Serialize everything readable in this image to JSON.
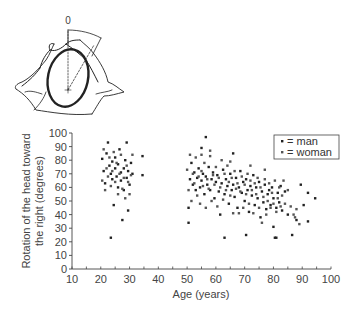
{
  "illustration": {
    "angle_label": "0",
    "description": "top-down drawing of a head on a pillow with rotation angle arc"
  },
  "chart_data": {
    "type": "scatter",
    "title": "",
    "xlabel": "Age (years)",
    "ylabel_line1": "Rotation of the head toward",
    "ylabel_line2": "the right (degrees)",
    "xlim": [
      10,
      100
    ],
    "ylim": [
      0,
      100
    ],
    "x_ticks": [
      10,
      20,
      30,
      40,
      50,
      60,
      70,
      80,
      90,
      100
    ],
    "y_ticks": [
      0,
      10,
      20,
      30,
      40,
      50,
      60,
      70,
      80,
      90,
      100
    ],
    "x_minor_step": 5,
    "grid": false,
    "legend_position": "upper right",
    "legend": [
      {
        "label": "= man",
        "color": "#222222"
      },
      {
        "label": "= woman",
        "color": "#555555"
      }
    ],
    "series": [
      {
        "name": "man",
        "color": "#222222",
        "points": [
          [
            20.5,
            81
          ],
          [
            21,
            72
          ],
          [
            21.5,
            63
          ],
          [
            22,
            85
          ],
          [
            22.5,
            93
          ],
          [
            23,
            76
          ],
          [
            23.5,
            23
          ],
          [
            23.5,
            70
          ],
          [
            24,
            66
          ],
          [
            24,
            79
          ],
          [
            24.5,
            47
          ],
          [
            25,
            74
          ],
          [
            25,
            82
          ],
          [
            25.5,
            68
          ],
          [
            26,
            60
          ],
          [
            26,
            77
          ],
          [
            26.5,
            88
          ],
          [
            27,
            71
          ],
          [
            27,
            65
          ],
          [
            27.5,
            36
          ],
          [
            28,
            74
          ],
          [
            28,
            58
          ],
          [
            28.5,
            80
          ],
          [
            29,
            93
          ],
          [
            29,
            67
          ],
          [
            29.5,
            43
          ],
          [
            29.5,
            72
          ],
          [
            30,
            62
          ],
          [
            30.5,
            78
          ],
          [
            31,
            70
          ],
          [
            34.5,
            83
          ],
          [
            34.5,
            69
          ],
          [
            50.5,
            34
          ],
          [
            50.5,
            45
          ],
          [
            51,
            66
          ],
          [
            51.5,
            78
          ],
          [
            52,
            62
          ],
          [
            52.5,
            71
          ],
          [
            53,
            58
          ],
          [
            53.5,
            67
          ],
          [
            54,
            74
          ],
          [
            54.5,
            60
          ],
          [
            55,
            89
          ],
          [
            55,
            65
          ],
          [
            55.5,
            70
          ],
          [
            56,
            55
          ],
          [
            56.5,
            97
          ],
          [
            56.5,
            68
          ],
          [
            57,
            62
          ],
          [
            57.5,
            75
          ],
          [
            58,
            58
          ],
          [
            58.5,
            66
          ],
          [
            59,
            71
          ],
          [
            59.5,
            52
          ],
          [
            60,
            64
          ],
          [
            60.5,
            69
          ],
          [
            61,
            57
          ],
          [
            61.5,
            40
          ],
          [
            62,
            63
          ],
          [
            62.5,
            73
          ],
          [
            63,
            23
          ],
          [
            63,
            55
          ],
          [
            63.5,
            66
          ],
          [
            64,
            61
          ],
          [
            64.5,
            48
          ],
          [
            65,
            70
          ],
          [
            65.5,
            58
          ],
          [
            66,
            85
          ],
          [
            66,
            62
          ],
          [
            66.5,
            53
          ],
          [
            67,
            67
          ],
          [
            67.5,
            45
          ],
          [
            68,
            60
          ],
          [
            68.5,
            72
          ],
          [
            69,
            56
          ],
          [
            69.5,
            64
          ],
          [
            70,
            50
          ],
          [
            70.5,
            25
          ],
          [
            70.5,
            66
          ],
          [
            71,
            58
          ],
          [
            71.5,
            42
          ],
          [
            72,
            61
          ],
          [
            72.5,
            54
          ],
          [
            73,
            69
          ],
          [
            73.5,
            47
          ],
          [
            74,
            60
          ],
          [
            74.5,
            52
          ],
          [
            75,
            64
          ],
          [
            75.5,
            38
          ],
          [
            76,
            57
          ],
          [
            76.5,
            49
          ],
          [
            77,
            62
          ],
          [
            77.5,
            44
          ],
          [
            78,
            55
          ],
          [
            78.5,
            58
          ],
          [
            79,
            47
          ],
          [
            79.5,
            60
          ],
          [
            80,
            31
          ],
          [
            80,
            52
          ],
          [
            80.5,
            23
          ],
          [
            81,
            23
          ],
          [
            81,
            45
          ],
          [
            81.5,
            56
          ],
          [
            82,
            49
          ],
          [
            82.5,
            61
          ],
          [
            83,
            43
          ],
          [
            84,
            57
          ],
          [
            85,
            40
          ],
          [
            86.5,
            25
          ],
          [
            88,
            36
          ],
          [
            89.5,
            62
          ],
          [
            90.5,
            47
          ],
          [
            92,
            56
          ],
          [
            92,
            35
          ],
          [
            94.5,
            52
          ]
        ]
      },
      {
        "name": "woman",
        "color": "#555555",
        "points": [
          [
            20.5,
            65
          ],
          [
            21,
            88
          ],
          [
            21.5,
            58
          ],
          [
            22,
            74
          ],
          [
            22.5,
            68
          ],
          [
            23,
            82
          ],
          [
            23.5,
            61
          ],
          [
            24,
            72
          ],
          [
            24.5,
            86
          ],
          [
            25,
            64
          ],
          [
            25.5,
            78
          ],
          [
            26,
            55
          ],
          [
            26.5,
            70
          ],
          [
            27,
            84
          ],
          [
            27.5,
            59
          ],
          [
            28,
            67
          ],
          [
            28.5,
            52
          ],
          [
            29,
            76
          ],
          [
            29.5,
            64
          ],
          [
            30,
            55
          ],
          [
            30.5,
            69
          ],
          [
            31,
            84
          ],
          [
            50,
            73
          ],
          [
            50.5,
            58
          ],
          [
            51,
            84
          ],
          [
            51.5,
            50
          ],
          [
            52,
            70
          ],
          [
            52.5,
            63
          ],
          [
            53,
            82
          ],
          [
            53.5,
            54
          ],
          [
            54,
            68
          ],
          [
            54.5,
            48
          ],
          [
            55,
            72
          ],
          [
            55.5,
            61
          ],
          [
            56,
            78
          ],
          [
            56.5,
            45
          ],
          [
            57,
            66
          ],
          [
            57.5,
            59
          ],
          [
            58,
            83
          ],
          [
            58.5,
            50
          ],
          [
            59,
            69
          ],
          [
            59.5,
            62
          ],
          [
            60,
            75
          ],
          [
            60.5,
            46
          ],
          [
            61,
            67
          ],
          [
            61.5,
            60
          ],
          [
            62,
            80
          ],
          [
            62.5,
            51
          ],
          [
            63,
            70
          ],
          [
            63.5,
            58
          ],
          [
            64,
            76
          ],
          [
            64.5,
            64
          ],
          [
            65,
            54
          ],
          [
            65.5,
            67
          ],
          [
            66,
            41
          ],
          [
            66.5,
            72
          ],
          [
            67,
            59
          ],
          [
            67.5,
            63
          ],
          [
            68,
            41
          ],
          [
            68.5,
            57
          ],
          [
            69,
            68
          ],
          [
            69.5,
            45
          ],
          [
            70,
            62
          ],
          [
            70.5,
            55
          ],
          [
            71,
            70
          ],
          [
            71.5,
            48
          ],
          [
            72,
            65
          ],
          [
            72.5,
            58
          ],
          [
            73,
            41
          ],
          [
            73.5,
            63
          ],
          [
            74,
            55
          ],
          [
            74.5,
            67
          ],
          [
            75,
            45
          ],
          [
            75.5,
            60
          ],
          [
            76,
            34
          ],
          [
            76.5,
            53
          ],
          [
            77,
            66
          ],
          [
            77.5,
            40
          ],
          [
            78,
            50
          ],
          [
            78.5,
            63
          ],
          [
            79,
            45
          ],
          [
            79.5,
            56
          ],
          [
            80,
            48
          ],
          [
            80.5,
            65
          ],
          [
            81,
            42
          ],
          [
            81.5,
            52
          ],
          [
            82,
            60
          ],
          [
            82.5,
            46
          ],
          [
            83,
            54
          ],
          [
            83.5,
            65
          ],
          [
            84,
            48
          ],
          [
            85,
            58
          ],
          [
            86,
            46
          ],
          [
            87,
            40
          ],
          [
            88,
            44
          ],
          [
            89,
            33
          ],
          [
            87.5,
            38
          ],
          [
            77,
            73
          ],
          [
            72,
            76
          ],
          [
            65,
            79
          ],
          [
            58,
            87
          ],
          [
            55,
            84
          ]
        ]
      }
    ]
  }
}
